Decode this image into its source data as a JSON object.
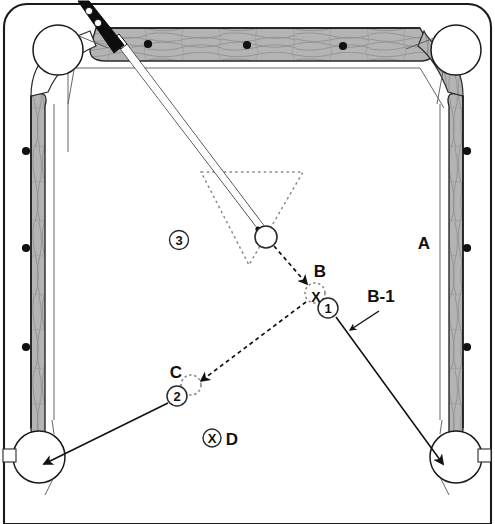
{
  "diagram": {
    "type": "billiards-instructional-diagram",
    "canvas": {
      "width": 495,
      "height": 524
    }
  },
  "colors": {
    "cloth": "#ffffff",
    "rail_wood": "#b0b0b0",
    "rail_wood_light": "#c8c8c8",
    "outline": "#1a1a1a",
    "sight_dot": "#111111",
    "cue_butt": "#0d0d0d",
    "cue_shaft": "#fdfdfd",
    "ball_outline": "#2a2a2a",
    "ghost_ball": "#888888",
    "label_text": "#111111"
  },
  "labels": {
    "region_a": "A",
    "region_three": "3",
    "point_b": "B",
    "point_b1": "B-1",
    "point_c": "C",
    "point_d": "D",
    "contact_x": "X",
    "ball_one": "1",
    "ball_two": "2",
    "spot_x": "X"
  },
  "table": {
    "rails": {
      "top": {
        "sight_dots": 3
      },
      "left": {
        "sight_dots": 3
      },
      "right": {
        "sight_dots": 3
      }
    },
    "pockets": [
      {
        "name": "top-left-pocket",
        "cx": 58,
        "cy": 50,
        "r": 25
      },
      {
        "name": "top-right-pocket",
        "cx": 456,
        "cy": 50,
        "r": 25
      },
      {
        "name": "bottom-left-pocket",
        "cx": 39,
        "cy": 457,
        "r": 26
      },
      {
        "name": "bottom-right-pocket",
        "cx": 456,
        "cy": 457,
        "r": 26
      }
    ]
  },
  "balls": {
    "cue_ball": {
      "name": "cue-ball",
      "cx": 266,
      "cy": 237,
      "r": 11,
      "style": "solid"
    },
    "ghost_ball_b": {
      "name": "ghost-ball-b",
      "cx": 315,
      "cy": 293,
      "r": 10,
      "style": "dashed"
    },
    "ghost_ball_c": {
      "name": "ghost-ball-c",
      "cx": 191,
      "cy": 385,
      "r": 10,
      "style": "dashed"
    },
    "object_ball_1": {
      "name": "object-ball-1",
      "cx": 328,
      "cy": 308,
      "r": 10,
      "style": "solid",
      "number": "1"
    },
    "object_ball_2": {
      "name": "object-ball-2",
      "cx": 177,
      "cy": 396,
      "r": 10,
      "style": "solid",
      "number": "2"
    }
  },
  "paths": {
    "cue_stroke": {
      "style": "double-line-solid",
      "from": [
        92,
        4
      ],
      "to": [
        258,
        229
      ]
    },
    "cue_ball_to_b": {
      "style": "dashed-arrow",
      "from": [
        274,
        246
      ],
      "to": [
        308,
        286
      ]
    },
    "b_to_c": {
      "style": "dashed-arrow",
      "from": [
        307,
        301
      ],
      "to": [
        199,
        382
      ]
    },
    "one_to_bottom_right_pocket": {
      "style": "solid-arrow",
      "from": [
        336,
        317
      ],
      "to": [
        441,
        462
      ]
    },
    "two_to_bottom_left_pocket": {
      "style": "solid-arrow",
      "from": [
        169,
        403
      ],
      "to": [
        46,
        464
      ]
    },
    "b1_pointer": {
      "style": "solid-arrow",
      "from": [
        377,
        312
      ],
      "to": [
        349,
        330
      ]
    }
  },
  "rack_triangle": {
    "name": "rack-outline",
    "style": "dotted",
    "vertices": [
      [
        201,
        172
      ],
      [
        303,
        172
      ],
      [
        249,
        265
      ]
    ]
  }
}
